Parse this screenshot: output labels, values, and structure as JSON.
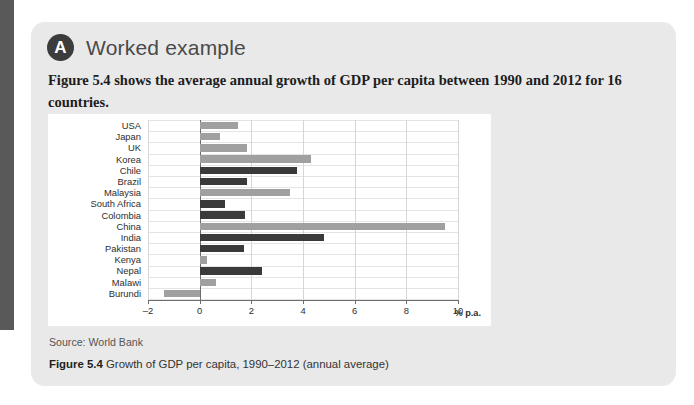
{
  "card": {
    "badge_letter": "A",
    "title": "Worked example",
    "intro": "Figure 5.4 shows the average annual growth of GDP per capita between 1990 and 2012 for 16 countries.",
    "source": "Source: World Bank",
    "caption_label": "Figure 5.4",
    "caption_text": "Growth of GDP per capita, 1990–2012 (annual average)"
  },
  "colors": {
    "bar_light": "#a0a0a0",
    "bar_dark": "#3a3a3a",
    "card_bg": "#e9e9e9",
    "panel_bg": "#ffffff",
    "tab": "#595959",
    "axis": "#6d6d6d"
  },
  "chart_data": {
    "type": "bar",
    "orientation": "horizontal",
    "title": "Growth of GDP per capita, 1990–2012 (annual average)",
    "xlabel": "% p.a.",
    "ylabel": "",
    "xlim": [
      -2,
      10
    ],
    "xticks": [
      -2,
      0,
      2,
      4,
      6,
      8,
      10
    ],
    "xtick_labels": [
      "–2",
      "0",
      "2",
      "4",
      "6",
      "8",
      "10"
    ],
    "grid": true,
    "legend": "none",
    "categories": [
      "USA",
      "Japan",
      "UK",
      "Korea",
      "Chile",
      "Brazil",
      "Malaysia",
      "South Africa",
      "Colombia",
      "China",
      "India",
      "Pakistan",
      "Kenya",
      "Nepal",
      "Malawi",
      "Burundi"
    ],
    "values": [
      1.5,
      0.8,
      1.85,
      4.3,
      3.75,
      1.85,
      3.5,
      1.0,
      1.75,
      9.5,
      4.8,
      1.7,
      0.3,
      2.4,
      0.65,
      -1.4
    ],
    "bar_shades": [
      "light",
      "light",
      "light",
      "light",
      "dark",
      "dark",
      "light",
      "dark",
      "dark",
      "light",
      "dark",
      "dark",
      "light",
      "dark",
      "light",
      "light"
    ],
    "source": "World Bank"
  }
}
